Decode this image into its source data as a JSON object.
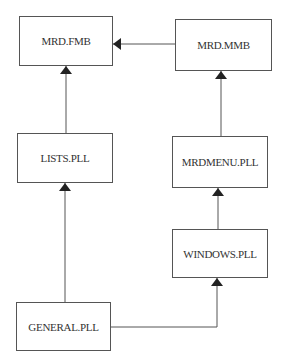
{
  "diagram": {
    "type": "dependency-graph",
    "nodes": [
      {
        "id": "mrd_fmb",
        "label": "MRD.FMB"
      },
      {
        "id": "mrd_mmb",
        "label": "MRD.MMB"
      },
      {
        "id": "lists_pll",
        "label": "LISTS.PLL"
      },
      {
        "id": "mrdmenu_pll",
        "label": "MRDMENU.PLL"
      },
      {
        "id": "windows_pll",
        "label": "WINDOWS.PLL"
      },
      {
        "id": "general_pll",
        "label": "GENERAL.PLL"
      }
    ],
    "edges": [
      {
        "from": "mrd_mmb",
        "to": "mrd_fmb"
      },
      {
        "from": "lists_pll",
        "to": "mrd_fmb"
      },
      {
        "from": "mrdmenu_pll",
        "to": "mrd_mmb"
      },
      {
        "from": "general_pll",
        "to": "lists_pll"
      },
      {
        "from": "windows_pll",
        "to": "mrdmenu_pll"
      },
      {
        "from": "general_pll",
        "to": "windows_pll"
      }
    ],
    "colors": {
      "line": "#555555",
      "text": "#333333",
      "background": "#ffffff"
    }
  }
}
